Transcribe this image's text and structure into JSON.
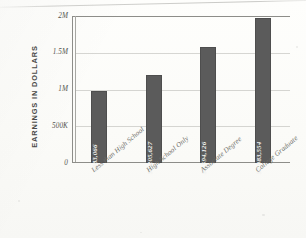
{
  "chart_data": {
    "type": "bar",
    "title": "",
    "subtitle": "",
    "xlabel": "",
    "ylabel": "EARNINGS IN DOLLARS",
    "categories": [
      "Less than High School",
      "High School Only",
      "Associate Degree",
      "College Graduate"
    ],
    "values": [
      983066,
      1205627,
      1594126,
      1983554
    ],
    "value_labels": [
      "$983,066",
      "$1,205,627",
      "$1,594,126",
      "$1,983,554"
    ],
    "ylim": [
      0,
      2000000
    ],
    "ytick_values": [
      0,
      500000,
      1000000,
      1500000,
      2000000
    ],
    "ytick_labels": [
      "0",
      "500K",
      "1M",
      "1.5M",
      "2M"
    ],
    "grid": true,
    "legend": false,
    "legend_position": "none",
    "bar_color": "#5b5b5b",
    "value_label_color": "#f2f2f0",
    "axis_color": "#8d8d89",
    "gridline_color": "#a0a09b",
    "background_color": "#fdfdfb"
  }
}
